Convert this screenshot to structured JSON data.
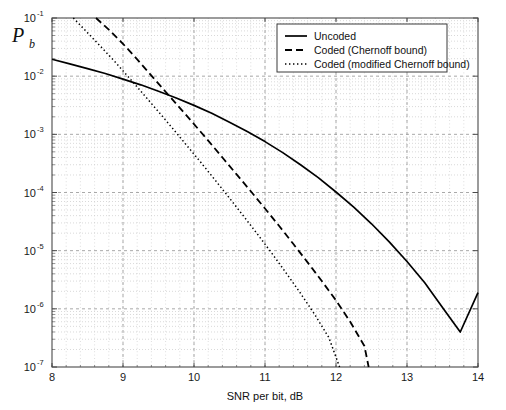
{
  "chart_data": {
    "type": "line",
    "title": "",
    "xlabel": "SNR per bit, dB",
    "ylabel": "P_b",
    "ylabel_base": "P",
    "ylabel_sub": "b",
    "xlim": [
      8,
      14
    ],
    "ylim": [
      1e-07,
      0.1
    ],
    "yscale": "log",
    "xscale": "linear",
    "xticks": [
      8,
      9,
      10,
      11,
      12,
      13,
      14
    ],
    "xtick_labels": [
      "8",
      "9",
      "10",
      "11",
      "12",
      "13",
      "14"
    ],
    "yticks": [
      0.1,
      0.01,
      0.001,
      0.0001,
      1e-05,
      1e-06,
      1e-07
    ],
    "ytick_labels": [
      "10",
      "10",
      "10",
      "10",
      "10",
      "10",
      "10"
    ],
    "ytick_exponents": [
      "-1",
      "-2",
      "-3",
      "-4",
      "-5",
      "-6",
      "-7"
    ],
    "grid": true,
    "grid_minor": true,
    "legend_position": "top-right",
    "series": [
      {
        "name": "Uncoded",
        "style": "solid",
        "color": "#000000",
        "points": [
          [
            8.0,
            0.0195
          ],
          [
            8.25,
            0.0163
          ],
          [
            8.5,
            0.0135
          ],
          [
            8.75,
            0.0111
          ],
          [
            9.0,
            0.0089
          ],
          [
            9.25,
            0.0071
          ],
          [
            9.5,
            0.0055
          ],
          [
            9.75,
            0.0042
          ],
          [
            10.0,
            0.00315
          ],
          [
            10.25,
            0.0023
          ],
          [
            10.5,
            0.00162
          ],
          [
            10.75,
            0.00112
          ],
          [
            11.0,
            0.00075
          ],
          [
            11.25,
            0.000485
          ],
          [
            11.5,
            0.0003
          ],
          [
            11.75,
            0.00018
          ],
          [
            12.0,
            0.000102
          ],
          [
            12.25,
            5.6e-05
          ],
          [
            12.5,
            2.9e-05
          ],
          [
            12.75,
            1.42e-05
          ],
          [
            13.0,
            6.5e-06
          ],
          [
            13.25,
            2.8e-06
          ],
          [
            13.5,
            1.05e-06
          ],
          [
            13.75,
            4e-07
          ],
          [
            14.0,
            1.9e-06
          ]
        ]
      },
      {
        "name": "Coded (Chernoff bound)",
        "style": "dashed",
        "color": "#000000",
        "points": [
          [
            8.62,
            0.1
          ],
          [
            8.8,
            0.063
          ],
          [
            9.0,
            0.036
          ],
          [
            9.2,
            0.0195
          ],
          [
            9.4,
            0.0102
          ],
          [
            9.6,
            0.0054
          ],
          [
            9.8,
            0.00285
          ],
          [
            10.0,
            0.0015
          ],
          [
            10.2,
            0.00078
          ],
          [
            10.4,
            0.0004
          ],
          [
            10.6,
            0.000205
          ],
          [
            10.8,
            0.000105
          ],
          [
            11.0,
            5.3e-05
          ],
          [
            11.2,
            2.65e-05
          ],
          [
            11.4,
            1.3e-05
          ],
          [
            11.6,
            6.3e-06
          ],
          [
            11.8,
            3e-06
          ],
          [
            12.0,
            1.4e-06
          ],
          [
            12.2,
            6e-07
          ],
          [
            12.4,
            2.3e-07
          ],
          [
            12.46,
            1e-07
          ]
        ]
      },
      {
        "name": "Coded (modified Chernoff bound)",
        "style": "dotted",
        "color": "#000000",
        "points": [
          [
            8.3,
            0.1
          ],
          [
            8.5,
            0.056
          ],
          [
            8.7,
            0.031
          ],
          [
            8.9,
            0.017
          ],
          [
            9.1,
            0.009
          ],
          [
            9.3,
            0.0047
          ],
          [
            9.5,
            0.00245
          ],
          [
            9.7,
            0.00126
          ],
          [
            9.9,
            0.00064
          ],
          [
            10.1,
            0.000325
          ],
          [
            10.3,
            0.000162
          ],
          [
            10.5,
            8e-05
          ],
          [
            10.7,
            3.9e-05
          ],
          [
            10.9,
            1.88e-05
          ],
          [
            11.1,
            8.9e-06
          ],
          [
            11.3,
            4.1e-06
          ],
          [
            11.5,
            1.85e-06
          ],
          [
            11.7,
            8e-07
          ],
          [
            11.9,
            3.2e-07
          ],
          [
            12.05,
            1e-07
          ]
        ]
      }
    ]
  },
  "legend": {
    "items": [
      {
        "label": "Uncoded",
        "style": "solid"
      },
      {
        "label": "Coded (Chernoff bound)",
        "style": "dashed"
      },
      {
        "label": "Coded (modified Chernoff bound)",
        "style": "dotted"
      }
    ]
  },
  "colors": {
    "background": "#ffffff",
    "axis": "#4a4a4a",
    "grid_major": "#9a9a9a",
    "grid_minor": "#c8c8c8",
    "curve": "#000000",
    "text": "#111111"
  }
}
